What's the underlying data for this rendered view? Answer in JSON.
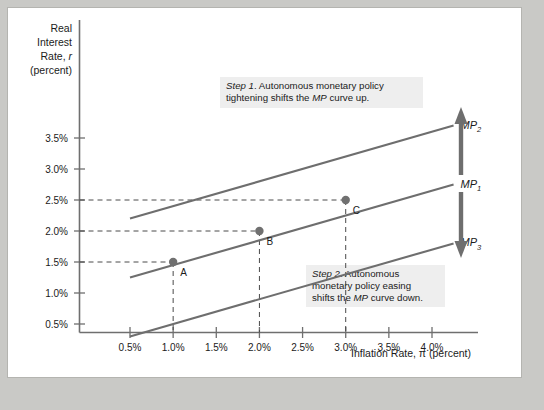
{
  "figure": {
    "background_color": "#ffffff",
    "frame_color": "#b4b4b0",
    "page_background": "#c9c9c6"
  },
  "chart_data": {
    "type": "line",
    "title": "",
    "xlabel": "Inflation Rate, π (percent)",
    "ylabel": "Real Interest Rate, r (percent)",
    "ylabel_lines": [
      "Real",
      "Interest",
      "Rate, r",
      "(percent)"
    ],
    "xlim": [
      0.25,
      4.25
    ],
    "ylim": [
      0.0,
      4.0
    ],
    "xticks": [
      "0.5%",
      "1.0%",
      "1.5%",
      "2.0%",
      "2.5%",
      "3.0%",
      "3.5%",
      "4.0%"
    ],
    "xtick_values": [
      0.5,
      1.0,
      1.5,
      2.0,
      2.5,
      3.0,
      3.5,
      4.0
    ],
    "yticks": [
      "0.5%",
      "1.0%",
      "1.5%",
      "2.0%",
      "2.5%",
      "3.0%",
      "3.5%"
    ],
    "ytick_values": [
      0.5,
      1.0,
      1.5,
      2.0,
      2.5,
      3.0,
      3.5
    ],
    "grid": false,
    "legend_position": "right-of-curves",
    "series": [
      {
        "name": "MP2",
        "label": "MP",
        "subscript": "2",
        "color": "#6e6e6e",
        "x": [
          0.5,
          4.25
        ],
        "y": [
          2.2,
          3.7
        ],
        "description": "MP curve after autonomous monetary policy tightening (shifted up)"
      },
      {
        "name": "MP1",
        "label": "MP",
        "subscript": "1",
        "color": "#6e6e6e",
        "x": [
          0.5,
          4.25
        ],
        "y": [
          1.25,
          2.75
        ],
        "description": "Original MP curve passing through points A, B and C"
      },
      {
        "name": "MP3",
        "label": "MP",
        "subscript": "3",
        "color": "#6e6e6e",
        "x": [
          0.5,
          4.25
        ],
        "y": [
          0.3,
          1.8
        ],
        "description": "MP curve after autonomous monetary policy easing (shifted down)"
      }
    ],
    "points": [
      {
        "label": "A",
        "x": 1.0,
        "y": 1.5,
        "on_curve": "MP1"
      },
      {
        "label": "B",
        "x": 2.0,
        "y": 2.0,
        "on_curve": "MP1"
      },
      {
        "label": "C",
        "x": 3.0,
        "y": 2.5,
        "on_curve": "MP1"
      }
    ],
    "annotations": [
      {
        "name": "step-1",
        "lead": "Step 1",
        "line1_rest": ". Autonomous monetary policy",
        "line2_a": "tightening shifts the ",
        "line2_em": "MP",
        "line2_b": " curve up.",
        "text": "Step 1. Autonomous monetary policy tightening shifts the MP curve up."
      },
      {
        "name": "step-2",
        "lead": "Step 2",
        "line1_rest": ". Autonomous",
        "line2": "monetary policy easing",
        "line3_a": "shifts the ",
        "line3_em": "MP",
        "line3_b": " curve down.",
        "text": "Step 2. Autonomous monetary policy easing shifts the MP curve down."
      }
    ],
    "shift_arrow": {
      "name": "mp-shift-arrow",
      "direction": "double-vertical",
      "color": "#6e6e6e",
      "meaning": "MP curve shifts up with tightening and down with easing"
    }
  }
}
